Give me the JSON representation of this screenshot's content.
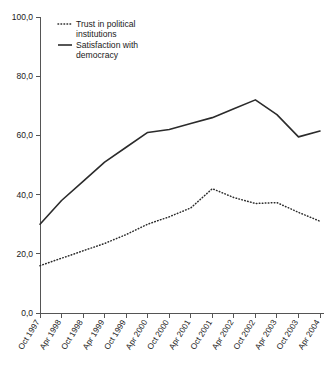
{
  "chart_data": {
    "type": "line",
    "title": "",
    "xlabel": "",
    "ylabel": "",
    "ylim": [
      0,
      100
    ],
    "yticks": [
      0,
      20,
      40,
      60,
      80,
      100
    ],
    "ytick_labels": [
      "0,0",
      "20,0",
      "40,0",
      "60,0",
      "80,0",
      "100,0"
    ],
    "grid": false,
    "legend_position": "top-left",
    "categories": [
      "Oct 1997",
      "Apr 1998",
      "Oct 1998",
      "Apr 1999",
      "Oct 1999",
      "Apr 2000",
      "Oct 2000",
      "Apr 2001",
      "Oct 2001",
      "Apr 2002",
      "Oct 2002",
      "Apr 2003",
      "Oct 2003",
      "Apr 2004"
    ],
    "series": [
      {
        "name": "Trust in political institutions",
        "style": "dotted",
        "color": "#2b2b2b",
        "values": [
          16.0,
          18.5,
          21.0,
          23.5,
          26.5,
          30.0,
          32.5,
          35.5,
          42.0,
          39.0,
          37.0,
          37.3,
          34.0,
          31.0
        ]
      },
      {
        "name": "Satisfaction with democracy",
        "style": "solid",
        "color": "#2b2b2b",
        "values": [
          30.0,
          38.0,
          44.5,
          51.0,
          56.0,
          61.0,
          62.0,
          64.0,
          66.0,
          69.0,
          72.0,
          67.0,
          59.5,
          61.5
        ]
      }
    ]
  },
  "legend": {
    "items": [
      {
        "label_line1": "Trust in political",
        "label_line2": "institutions",
        "style": "dotted"
      },
      {
        "label_line1": "Satisfaction with",
        "label_line2": "democracy",
        "style": "solid"
      }
    ]
  },
  "caption": {
    "text": ""
  }
}
